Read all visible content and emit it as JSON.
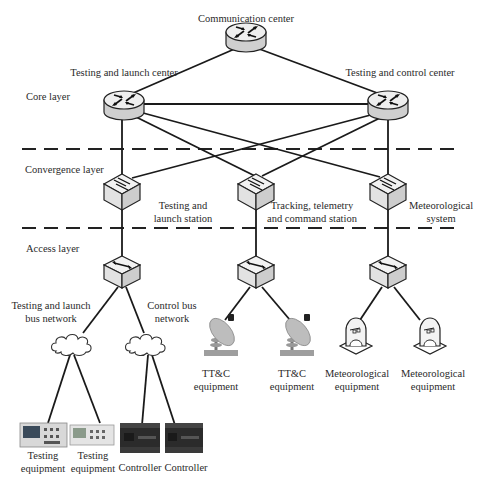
{
  "layers": {
    "core": "Core layer",
    "convergence": "Convergence layer",
    "access": "Access layer"
  },
  "core_nodes": {
    "communication_center": "Communication center",
    "testing_launch_center": "Testing and launch center",
    "testing_control_center": "Testing and control center"
  },
  "convergence_nodes": {
    "testing_launch_station_l1": "Testing and",
    "testing_launch_station_l2": "launch station",
    "ttc_station_l1": "Tracking, telemetry",
    "ttc_station_l2": "and command station",
    "meteorological_system_l1": "Meteorological",
    "meteorological_system_l2": "system"
  },
  "access_nodes": {
    "testing_launch_bus_l1": "Testing and launch",
    "testing_launch_bus_l2": "bus network",
    "control_bus_l1": "Control bus",
    "control_bus_l2": "network"
  },
  "equipment": [
    {
      "l1": "Testing",
      "l2": "equipment"
    },
    {
      "l1": "Testing",
      "l2": "equipment"
    },
    {
      "l1": "Controller",
      "l2": ""
    },
    {
      "l1": "Controller",
      "l2": ""
    },
    {
      "l1": "TT&C",
      "l2": "equipment"
    },
    {
      "l1": "TT&C",
      "l2": "equipment"
    },
    {
      "l1": "Meteorological",
      "l2": "equipment"
    },
    {
      "l1": "Meteorological",
      "l2": "equipment"
    }
  ],
  "icons": {
    "router": "router-icon",
    "convergence_switch": "multilayer-switch-icon",
    "access_switch": "access-switch-icon",
    "cloud": "cloud-network-icon",
    "dish": "satellite-dish-icon",
    "radar": "weather-radar-icon",
    "oscilloscope": "oscilloscope-icon",
    "plc": "plc-controller-icon"
  },
  "colors": {
    "line": "#1a1a1a",
    "router_top": "#eeeeee",
    "router_side": "#cfcfcf",
    "switch_top": "#f2f2f2",
    "switch_side": "#d2d2d2",
    "dish": "#bdbdbd",
    "controller": "#2b2b2b"
  }
}
